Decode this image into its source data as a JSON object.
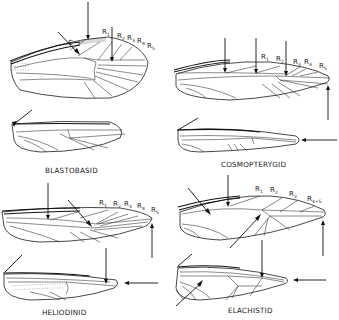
{
  "figure": {
    "type": "wing venation comparison",
    "panels": [
      {
        "id": "blastobasid",
        "family_label": "BLASTOBASID",
        "forewing_labels": [
          "C",
          "R1",
          "R2",
          "R3",
          "R4",
          "R5"
        ],
        "arrows": 4
      },
      {
        "id": "cosmopterygid",
        "family_label": "COSMOPTERYGID",
        "forewing_labels": [
          "R1",
          "R2",
          "R3",
          "R4",
          "R5"
        ],
        "arrows": 6
      },
      {
        "id": "heliodinid",
        "family_label": "HELIODINID",
        "forewing_labels": [
          "R1",
          "R2",
          "R3",
          "R4",
          "R5"
        ],
        "arrows": 6
      },
      {
        "id": "elachistid",
        "family_label": "ELACHISTID",
        "forewing_labels": [
          "R1",
          "R2",
          "R3",
          "R4+5"
        ],
        "arrows": 8
      }
    ],
    "label_text": {
      "C": "C",
      "R": "R",
      "sub1": "1",
      "sub2": "2",
      "sub3": "3",
      "sub4": "4",
      "sub5": "5",
      "sub45": "4+5"
    },
    "colors": {
      "line": "#1a1a1a",
      "background": "#ffffff"
    }
  }
}
